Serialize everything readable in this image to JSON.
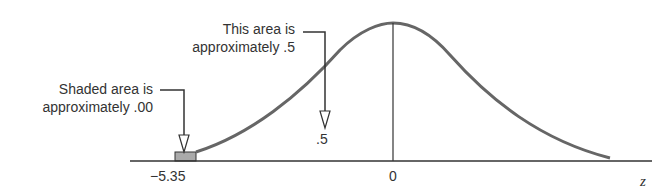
{
  "diagram": {
    "type": "normal-curve",
    "annotations": [
      {
        "line1": "This area is",
        "line2": "approximately .5"
      },
      {
        "line1": "Shaded area is",
        "line2": "approximately .00"
      }
    ],
    "marker_label": ".5",
    "axis": {
      "ticks": [
        "−5.35",
        "0"
      ],
      "variable": "z"
    },
    "colors": {
      "curve": "#666666",
      "shade": "#aaaaaa",
      "line": "#333333"
    }
  }
}
